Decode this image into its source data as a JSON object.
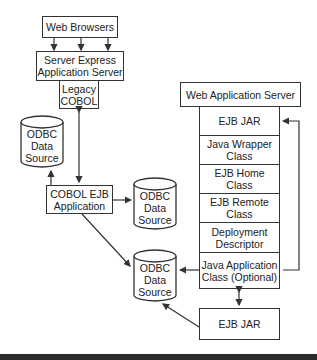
{
  "diagram": {
    "left_stack": {
      "web_browsers": "Web Browsers",
      "server_express": "Server Express\nApplication Server",
      "legacy_cobol": "Legacy\nCOBOL",
      "cobol_ejb_app": "COBOL EJB\nApplication"
    },
    "data_sources": [
      {
        "label": "ODBC\nData\nSource",
        "position": "upper-left"
      },
      {
        "label": "ODBC\nData\nSource",
        "position": "middle"
      },
      {
        "label": "ODBC\nData\nSource",
        "position": "lower"
      }
    ],
    "right_stack": {
      "title": "Web Application Server",
      "components": [
        "EJB JAR",
        "Java Wrapper\nClass",
        "EJB Home\nClass",
        "EJB Remote\nClass",
        "Deployment\nDescriptor",
        "Java Application\nClass (Optional)"
      ],
      "bottom_jar": "EJB JAR"
    },
    "colors": {
      "line": "#333333",
      "bar": "#2a2a2a"
    }
  }
}
